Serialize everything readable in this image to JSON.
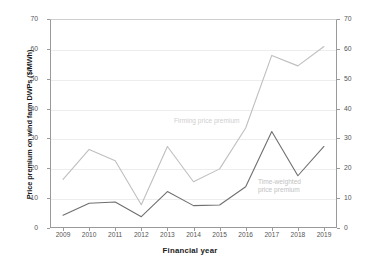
{
  "chart_data": {
    "type": "line",
    "title": "",
    "xlabel": "Financial year",
    "ylabel": "Price premium on wind farm DWPs ($/MWh)",
    "categories": [
      "2009",
      "2010",
      "2011",
      "2012",
      "2013",
      "2014",
      "2015",
      "2016",
      "2017",
      "2018",
      "2019"
    ],
    "ylim": [
      0,
      70
    ],
    "y_ticks": [
      0,
      10,
      20,
      30,
      40,
      50,
      60,
      70
    ],
    "y_ticks_right": [
      0,
      10,
      20,
      30,
      40,
      50,
      60,
      70
    ],
    "grid": true,
    "legend_position": "inline-annotation",
    "series": [
      {
        "name": "Firming price premium",
        "color": "#bfbfbf",
        "values": [
          16.3,
          26.3,
          22.5,
          7.8,
          27.3,
          15.5,
          19.8,
          33.5,
          57.8,
          54.3,
          60.8
        ]
      },
      {
        "name": "Time-weighted price premium",
        "color": "#6f6f6f",
        "values": [
          4.3,
          8.3,
          8.7,
          3.8,
          12.2,
          7.5,
          7.7,
          13.8,
          32.3,
          17.5,
          27.3
        ]
      }
    ],
    "annotations": [
      {
        "text": "Firming price premium",
        "series": "Firming price premium"
      },
      {
        "text": "Time-weighted\nprice premium",
        "series": "Time-weighted price premium"
      }
    ]
  }
}
